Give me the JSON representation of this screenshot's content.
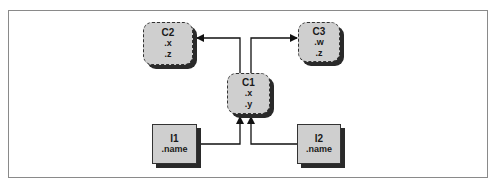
{
  "diagram": {
    "type": "inheritance",
    "nodes": [
      {
        "id": "C2",
        "kind": "class",
        "title": "C2",
        "attrs": [
          ".x",
          ".z"
        ]
      },
      {
        "id": "C3",
        "kind": "class",
        "title": "C3",
        "attrs": [
          ".w",
          ".z"
        ]
      },
      {
        "id": "C1",
        "kind": "class",
        "title": "C1",
        "attrs": [
          ".x",
          ".y"
        ]
      },
      {
        "id": "I1",
        "kind": "instance",
        "title": "I1",
        "attrs": [
          ".name"
        ]
      },
      {
        "id": "I2",
        "kind": "instance",
        "title": "I2",
        "attrs": [
          ".name"
        ]
      }
    ],
    "edges": [
      {
        "from": "C1",
        "to": "C2"
      },
      {
        "from": "C1",
        "to": "C3"
      },
      {
        "from": "I1",
        "to": "C1"
      },
      {
        "from": "I2",
        "to": "C1"
      }
    ],
    "colors": {
      "node_fill": "#cfcfcf",
      "shadow": "#2a2a2a",
      "line": "#111111",
      "frame": "#8a8a8a"
    }
  }
}
